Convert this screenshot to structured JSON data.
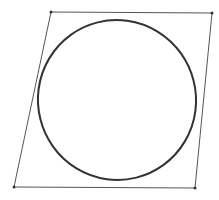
{
  "diagram": {
    "parallelogram": {
      "vertices": [
        {
          "name": "top-left",
          "x": 51,
          "y": 12
        },
        {
          "name": "top-right",
          "x": 212,
          "y": 13
        },
        {
          "name": "bottom-right",
          "x": 195,
          "y": 188
        },
        {
          "name": "bottom-left",
          "x": 14,
          "y": 187
        }
      ],
      "stroke": "#555555",
      "stroke_width": 1,
      "vertex_marker_color": "#333333"
    },
    "ellipse": {
      "cx": 117,
      "cy": 100,
      "rx": 79,
      "ry": 80,
      "rotation_deg": -14,
      "stroke": "#333333",
      "stroke_width": 2
    },
    "background": "#ffffff"
  }
}
